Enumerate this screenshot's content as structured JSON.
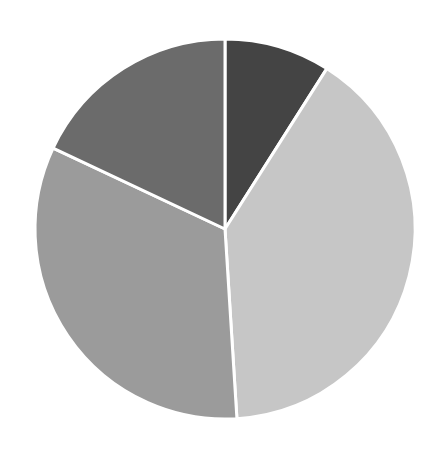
{
  "chart_data": {
    "type": "pie",
    "title": "",
    "legend": [],
    "start_angle_deg": 0,
    "direction": "clockwise",
    "center": [
      225,
      229
    ],
    "radius": 190,
    "categories": [
      "Slice 1",
      "Slice 2",
      "Slice 3",
      "Slice 4"
    ],
    "values": [
      9,
      40,
      33,
      18
    ],
    "colors": [
      "#444444",
      "#c6c6c6",
      "#9b9b9b",
      "#6b6b6b"
    ],
    "show_labels": false
  }
}
